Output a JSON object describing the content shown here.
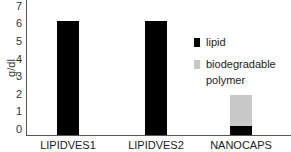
{
  "chart_data": {
    "type": "bar",
    "stacked": true,
    "title": "",
    "xlabel": "",
    "ylabel": "g/dl",
    "ylim": [
      0,
      7
    ],
    "yticks": [
      "0",
      "1",
      "2",
      "3",
      "4",
      "5",
      "6",
      "7"
    ],
    "categories": [
      "LIPIDVES1",
      "LIPIDVES2",
      "NANOCAPS"
    ],
    "series": [
      {
        "name": "lipid",
        "color": "#000000",
        "values": [
          6.5,
          6.5,
          0.5
        ]
      },
      {
        "name": "biodegradable polymer",
        "color": "#c8c8c8",
        "values": [
          0,
          0,
          1.8
        ]
      }
    ],
    "grid": false,
    "legend_position": "right"
  },
  "legend": {
    "items": [
      {
        "label": "lipid",
        "color": "#000000"
      },
      {
        "label_line1": "biodegradable",
        "label_line2": "polymer",
        "color": "#c8c8c8"
      }
    ]
  }
}
